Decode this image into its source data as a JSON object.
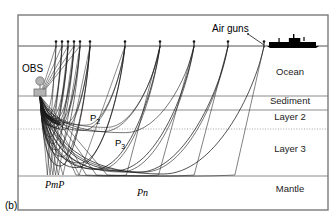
{
  "figure": {
    "panel_label": "(b)",
    "caption_kind": "seismic-refraction-ray-diagram"
  },
  "layers": [
    {
      "id": "ocean",
      "label": "Ocean",
      "label_x": 290,
      "label_y": 75,
      "top_y": 46,
      "bottom_y": 96
    },
    {
      "id": "sediment",
      "label": "Sediment",
      "label_x": 290,
      "label_y": 104,
      "top_y": 96,
      "bottom_y": 110
    },
    {
      "id": "layer2",
      "label": "Layer 2",
      "label_x": 290,
      "label_y": 120,
      "top_y": 110,
      "bottom_y": 129
    },
    {
      "id": "layer3",
      "label": "Layer 3",
      "label_x": 290,
      "label_y": 152,
      "top_y": 129,
      "bottom_y": 176
    },
    {
      "id": "mantle",
      "label": "Mantle",
      "label_x": 290,
      "label_y": 192,
      "top_y": 176,
      "bottom_y": 210
    }
  ],
  "boundaries": [
    {
      "id": "sea-surface",
      "y": 46,
      "style": "solid"
    },
    {
      "id": "seafloor",
      "y": 96,
      "style": "solid"
    },
    {
      "id": "sediment-base",
      "y": 110,
      "style": "solid"
    },
    {
      "id": "layer2-base",
      "y": 129,
      "style": "dotted"
    },
    {
      "id": "moho",
      "y": 176,
      "style": "solid"
    }
  ],
  "instrument": {
    "label": "OBS",
    "label_x": 22,
    "label_y": 72,
    "x": 40,
    "float_y": 81,
    "body_y": 90
  },
  "source": {
    "label": "Air guns",
    "label_x": 212,
    "label_y": 32,
    "pointer_from_x": 248,
    "pointer_from_y": 34,
    "pointer_to_x": 264,
    "pointer_to_y": 45
  },
  "vessel": {
    "name": "research-ship",
    "x": 267,
    "y": 36,
    "width": 52,
    "height": 12
  },
  "shot_points": [
    {
      "x": 56,
      "y": 46
    },
    {
      "x": 62,
      "y": 46
    },
    {
      "x": 68,
      "y": 46
    },
    {
      "x": 74,
      "y": 46
    },
    {
      "x": 80,
      "y": 46
    },
    {
      "x": 90,
      "y": 46
    },
    {
      "x": 125,
      "y": 46
    },
    {
      "x": 160,
      "y": 46
    },
    {
      "x": 194,
      "y": 46
    },
    {
      "x": 228,
      "y": 46
    },
    {
      "x": 264,
      "y": 46
    }
  ],
  "phases": [
    {
      "id": "p2",
      "label": "P",
      "sub": "2",
      "x": 90,
      "y": 121,
      "style": "plain"
    },
    {
      "id": "p3",
      "label": "P",
      "sub": "3",
      "x": 115,
      "y": 146,
      "style": "plain"
    },
    {
      "id": "pmp",
      "label": "PmP",
      "sub": "",
      "x": 45,
      "y": 188,
      "style": "italic"
    },
    {
      "id": "pn",
      "label": "Pn",
      "sub": "",
      "x": 137,
      "y": 196,
      "style": "italic"
    }
  ],
  "frame": {
    "x": 18,
    "y": 15,
    "width": 310,
    "height": 195
  },
  "colors": {
    "ray": "#1a1a1a",
    "boundary": "#8c8c8c",
    "frame": "#7a7a7a",
    "obs_fill": "#b3b3b3",
    "obs_stroke": "#6e6e6e",
    "vessel": "#000000",
    "text": "#1a1a1a",
    "background": "#ffffff"
  }
}
